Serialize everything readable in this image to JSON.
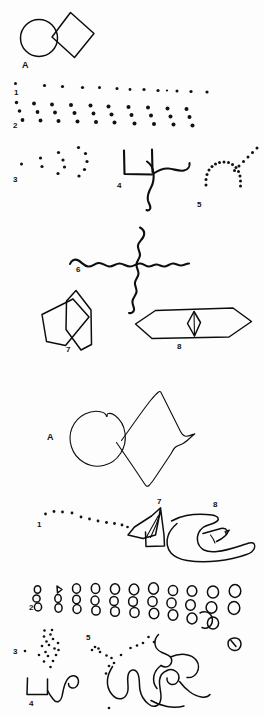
{
  "figure": {
    "background_color": "#fdfdfd",
    "ink_color": "#0d0d0d",
    "width": 264,
    "height": 715,
    "panels": [
      {
        "id": "top-panel",
        "name": "model-stimuli-panel",
        "description": "Reference geometric stimuli",
        "items": [
          {
            "label": "A",
            "name": "circle-and-diamond-model",
            "kind": "outline-shapes"
          },
          {
            "label": "1",
            "name": "dot-row-model",
            "kind": "dot-pattern"
          },
          {
            "label": "2",
            "name": "dot-triplet-array-model",
            "kind": "dot-pattern"
          },
          {
            "label": "3",
            "name": "dot-arcs-model",
            "kind": "dot-pattern"
          },
          {
            "label": "4",
            "name": "angular-wave-model",
            "kind": "line-drawing"
          },
          {
            "label": "5",
            "name": "dotted-arch-model",
            "kind": "dot-pattern"
          },
          {
            "label": "6",
            "name": "wavy-cross-model",
            "kind": "line-drawing"
          },
          {
            "label": "7",
            "name": "overlapping-kites-model",
            "kind": "outline-shapes"
          },
          {
            "label": "8",
            "name": "hexagon-with-diamond-model",
            "kind": "outline-shapes"
          }
        ]
      },
      {
        "id": "bottom-panel",
        "name": "patient-reproduction-panel",
        "description": "Hand-drawn reproductions of the stimuli",
        "items": [
          {
            "label": "A",
            "name": "circle-and-diamond-copy",
            "kind": "outline-shapes"
          },
          {
            "label": "1",
            "name": "dot-row-copy",
            "kind": "dot-pattern"
          },
          {
            "label": "7",
            "name": "overlapping-kites-copy",
            "kind": "outline-shapes"
          },
          {
            "label": "8",
            "name": "hexagon-with-diamond-copy",
            "kind": "outline-shapes"
          },
          {
            "label": "2",
            "name": "circle-triplet-array-copy",
            "kind": "outline-shapes"
          },
          {
            "label": "3",
            "name": "dot-arcs-copy",
            "kind": "dot-pattern"
          },
          {
            "label": "5",
            "name": "dotted-arch-copy",
            "kind": "dot-pattern"
          },
          {
            "label": "4",
            "name": "angular-wave-copy",
            "kind": "line-drawing"
          }
        ]
      }
    ]
  },
  "labels": {
    "top": {
      "A": "A",
      "n1": "1",
      "n2": "2",
      "n3": "3",
      "n4": "4",
      "n5": "5",
      "n6": "6",
      "n7": "7",
      "n8": "8"
    },
    "bottom": {
      "A": "A",
      "n1": "1",
      "n2": "2",
      "n3": "3",
      "n4": "4",
      "n5": "5",
      "n7": "7",
      "n8": "8"
    }
  }
}
